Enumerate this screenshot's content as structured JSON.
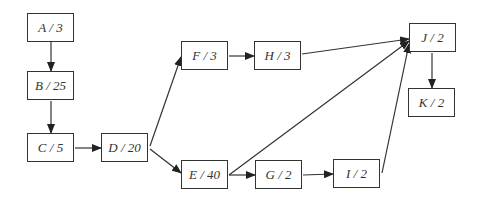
{
  "diagram": {
    "type": "activity-on-node network",
    "nodes": [
      {
        "id": "A",
        "label": "A / 3",
        "x": 27,
        "y": 13
      },
      {
        "id": "B",
        "label": "B / 25",
        "x": 27,
        "y": 71
      },
      {
        "id": "C",
        "label": "C / 5",
        "x": 27,
        "y": 133
      },
      {
        "id": "D",
        "label": "D / 20",
        "x": 101,
        "y": 133
      },
      {
        "id": "F",
        "label": "F / 3",
        "x": 181,
        "y": 41
      },
      {
        "id": "H",
        "label": "H / 3",
        "x": 254,
        "y": 41
      },
      {
        "id": "E",
        "label": "E / 40",
        "x": 181,
        "y": 160
      },
      {
        "id": "G",
        "label": "G / 2",
        "x": 255,
        "y": 160
      },
      {
        "id": "I",
        "label": "I / 2",
        "x": 333,
        "y": 159
      },
      {
        "id": "J",
        "label": "J / 2",
        "x": 409,
        "y": 23
      },
      {
        "id": "K",
        "label": "K / 2",
        "x": 408,
        "y": 88
      }
    ],
    "edges": [
      {
        "from": "A",
        "to": "B"
      },
      {
        "from": "B",
        "to": "C"
      },
      {
        "from": "C",
        "to": "D"
      },
      {
        "from": "D",
        "to": "F"
      },
      {
        "from": "D",
        "to": "E"
      },
      {
        "from": "F",
        "to": "H"
      },
      {
        "from": "H",
        "to": "J"
      },
      {
        "from": "E",
        "to": "J"
      },
      {
        "from": "E",
        "to": "G"
      },
      {
        "from": "G",
        "to": "I"
      },
      {
        "from": "I",
        "to": "J"
      },
      {
        "from": "J",
        "to": "K"
      }
    ]
  }
}
